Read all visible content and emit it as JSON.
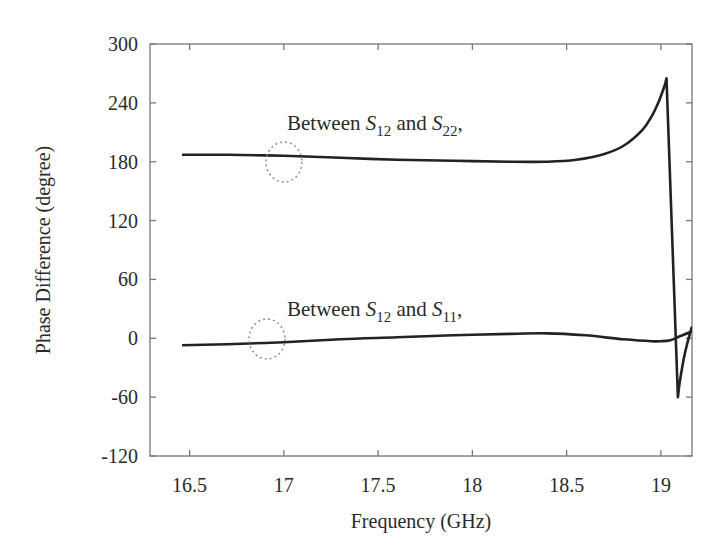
{
  "chart_data": {
    "type": "line",
    "title": "",
    "xlabel": "Frequency (GHz)",
    "ylabel": "Phase Difference (degree)",
    "xlim": [
      16.29,
      19.165
    ],
    "ylim": [
      -120,
      300
    ],
    "xticks": [
      16.5,
      17,
      17.5,
      18,
      18.5,
      19
    ],
    "xtick_labels": [
      "16.5",
      "17",
      "17.5",
      "18",
      "18.5",
      "19"
    ],
    "yticks": [
      -120,
      -60,
      0,
      60,
      120,
      180,
      240,
      300
    ],
    "ytick_labels": [
      "-120",
      "-60",
      "0",
      "60",
      "120",
      "180",
      "240",
      "300"
    ],
    "grid": false,
    "legend": "none (inline annotations)",
    "series": [
      {
        "name": "Between S12 and S22",
        "color": "#222222",
        "x": [
          16.46,
          16.7,
          17.0,
          17.3,
          17.6,
          17.9,
          18.2,
          18.4,
          18.55,
          18.7,
          18.8,
          18.9,
          18.95,
          18.99,
          19.02,
          19.03,
          19.09,
          19.1,
          19.12,
          19.14,
          19.165
        ],
        "y": [
          187,
          187,
          186,
          184,
          182,
          181,
          180,
          180,
          182,
          188,
          196,
          212,
          226,
          242,
          258,
          265,
          -60,
          -45,
          -22,
          -5,
          12
        ]
      },
      {
        "name": "Between S12 and S11",
        "color": "#222222",
        "x": [
          16.46,
          16.7,
          17.0,
          17.3,
          17.6,
          17.9,
          18.2,
          18.4,
          18.6,
          18.8,
          18.95,
          19.0,
          19.05,
          19.1,
          19.165
        ],
        "y": [
          -7,
          -6,
          -4,
          -1,
          1,
          3,
          4.5,
          5,
          3,
          -1,
          -3,
          -3,
          -2,
          2,
          7
        ]
      }
    ],
    "annotations": [
      {
        "text": "Between S12 and S22,",
        "near_series": "Between S12 and S22",
        "marker": "dotted circle at ~17.0 GHz, 180°"
      },
      {
        "text": "Between S12 and S11,",
        "near_series": "Between S12 and S11",
        "marker": "dotted circle at ~16.9 GHz, 0°"
      }
    ]
  },
  "labels": {
    "xlabel": "Frequency (GHz)",
    "ylabel": "Phase Difference (degree)",
    "annot_upper": {
      "prefix": "Between ",
      "s1": "S",
      "s1_sub": "12",
      "mid": " and ",
      "s2": "S",
      "s2_sub": "22",
      "suffix": ","
    },
    "annot_lower": {
      "prefix": "Between ",
      "s1": "S",
      "s1_sub": "12",
      "mid": " and ",
      "s2": "S",
      "s2_sub": "11",
      "suffix": ","
    }
  },
  "style": {
    "line_color": "#222222",
    "axis_color": "#777777",
    "circle_color": "#888888"
  }
}
